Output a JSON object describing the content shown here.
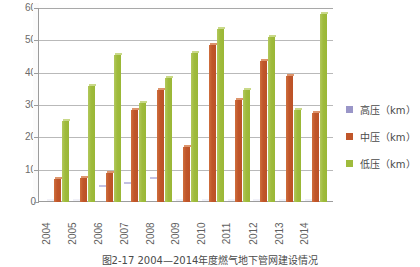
{
  "chart_data": {
    "type": "bar",
    "title": "",
    "xlabel": "",
    "ylabel": "",
    "ylim": [
      0,
      60
    ],
    "ytick_step": 10,
    "yticks": [
      "60",
      "50",
      "40",
      "30",
      "20",
      "10",
      "0"
    ],
    "grid": "horizontal",
    "legend_position": "right",
    "categories": [
      "2004",
      "2005",
      "2006",
      "2007",
      "2008",
      "2009",
      "2010",
      "2011",
      "2012",
      "2013",
      "2014"
    ],
    "series": [
      {
        "name": "高压（km）",
        "color": "#9a96c8",
        "values": [
          0,
          0,
          4.5,
          5.5,
          7,
          0,
          0,
          0,
          0,
          0,
          0
        ]
      },
      {
        "name": "中压（km）",
        "color": "#c0562a",
        "values": [
          7,
          7.5,
          9,
          28.5,
          34.5,
          17,
          48.5,
          31.5,
          43.5,
          39,
          27.5
        ]
      },
      {
        "name": "低压（km）",
        "color": "#9fbb3c",
        "values": [
          25,
          36,
          45.5,
          30.5,
          38.5,
          46,
          53.5,
          34.5,
          51,
          28.5,
          58
        ]
      }
    ]
  },
  "legend": {
    "items": [
      {
        "label": "高压（km）"
      },
      {
        "label": "中压（km）"
      },
      {
        "label": "低压（km）"
      }
    ]
  },
  "caption": {
    "text": "图2-17  2004—2014年度燃气地下管网建设情况"
  }
}
